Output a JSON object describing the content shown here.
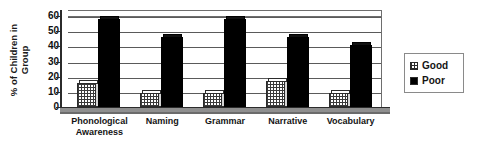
{
  "chart_data": {
    "type": "bar",
    "title": "",
    "xlabel": "",
    "ylabel": "% of Children in Group",
    "ylabel_lines": [
      "% of Children in",
      "Group"
    ],
    "categories": [
      "Phonological Awareness",
      "Naming",
      "Grammar",
      "Narrative",
      "Vocabulary"
    ],
    "category_lines": [
      [
        "Phonological",
        "Awareness"
      ],
      [
        "Naming",
        ""
      ],
      [
        "Grammar",
        ""
      ],
      [
        "Narrative",
        ""
      ],
      [
        "Vocabulary",
        ""
      ]
    ],
    "series": [
      {
        "name": "Good",
        "values": [
          16,
          9,
          9,
          17,
          9
        ],
        "color": "#ffffff",
        "pattern": "checkered-hatch"
      },
      {
        "name": "Poor",
        "values": [
          58,
          46,
          58,
          46,
          41
        ],
        "color": "#000000",
        "pattern": "solid"
      }
    ],
    "ylim": [
      0,
      60
    ],
    "ytick_values": [
      0,
      10,
      20,
      30,
      40,
      50,
      60
    ],
    "ytick_labels": [
      "0",
      "10",
      "20",
      "30",
      "40",
      "50",
      "60"
    ],
    "grid": true,
    "grid_axis": "y",
    "legend": {
      "position": "right",
      "entries": [
        {
          "label": "Good",
          "swatch": "checkered-hatch"
        },
        {
          "label": "Poor",
          "swatch": "solid-black"
        }
      ]
    },
    "style": "3d-bar",
    "background": "#ffffff",
    "axis_color": "#2b2b2b",
    "grid_color": "#5a5a5a"
  }
}
